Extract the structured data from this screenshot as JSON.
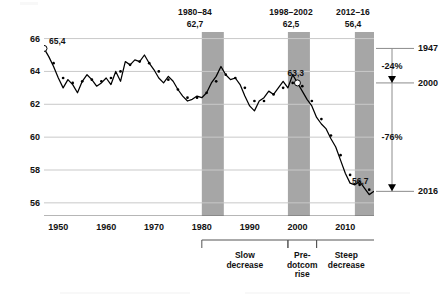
{
  "chart_data": {
    "type": "line",
    "title": "",
    "subtitle": "",
    "xlabel": "",
    "ylabel": "",
    "xlim": [
      1947,
      2016
    ],
    "ylim": [
      55.2,
      66.4
    ],
    "yticks": [
      56,
      58,
      60,
      62,
      64,
      66
    ],
    "ytick_labels": [
      "56",
      "58",
      "60",
      "62",
      "64",
      "66"
    ],
    "xticks": [
      1950,
      1960,
      1970,
      1980,
      1990,
      2000,
      2010
    ],
    "xtick_labels": [
      "1950",
      "1960",
      "1970",
      "1980",
      "1990",
      "2000",
      "2010"
    ],
    "grid": "horizontal",
    "legend": "none",
    "decimal_separator": ",",
    "series": [
      {
        "name": "annual-value",
        "style": "solid-line",
        "color": "#000000",
        "x": [
          1947,
          1948,
          1949,
          1950,
          1951,
          1952,
          1953,
          1954,
          1955,
          1956,
          1957,
          1958,
          1959,
          1960,
          1961,
          1962,
          1963,
          1964,
          1965,
          1966,
          1967,
          1968,
          1969,
          1970,
          1971,
          1972,
          1973,
          1974,
          1975,
          1976,
          1977,
          1978,
          1979,
          1980,
          1981,
          1982,
          1983,
          1984,
          1985,
          1986,
          1987,
          1988,
          1989,
          1990,
          1991,
          1992,
          1993,
          1994,
          1995,
          1996,
          1997,
          1998,
          1999,
          2000,
          2001,
          2002,
          2003,
          2004,
          2005,
          2006,
          2007,
          2008,
          2009,
          2010,
          2011,
          2012,
          2013,
          2014,
          2015,
          2016
        ],
        "values": [
          65.4,
          64.9,
          64.3,
          63.6,
          63.0,
          63.5,
          63.2,
          62.7,
          63.4,
          63.8,
          63.5,
          63.1,
          63.3,
          63.6,
          63.2,
          64.0,
          63.4,
          64.6,
          64.4,
          64.7,
          64.6,
          65.0,
          64.5,
          64.1,
          63.6,
          63.3,
          63.7,
          63.4,
          62.9,
          62.5,
          62.2,
          62.3,
          62.5,
          62.4,
          62.7,
          63.3,
          63.7,
          64.3,
          63.8,
          63.5,
          63.6,
          63.2,
          62.5,
          61.9,
          61.6,
          62.2,
          62.4,
          62.8,
          62.6,
          63.0,
          63.4,
          63.0,
          63.8,
          63.3,
          62.8,
          62.3,
          61.9,
          61.2,
          60.8,
          60.5,
          59.9,
          59.4,
          58.6,
          57.8,
          57.2,
          57.1,
          57.3,
          56.9,
          56.5,
          56.7
        ]
      },
      {
        "name": "smoothed-trend",
        "style": "dotted-line",
        "color": "#000000",
        "x": [
          1947,
          1948,
          1949,
          1950,
          1951,
          1952,
          1953,
          1954,
          1955,
          1956,
          1957,
          1958,
          1959,
          1960,
          1961,
          1962,
          1963,
          1964,
          1965,
          1966,
          1967,
          1968,
          1969,
          1970,
          1971,
          1972,
          1973,
          1974,
          1975,
          1976,
          1977,
          1978,
          1979,
          1980,
          1981,
          1982,
          1983,
          1984,
          1985,
          1986,
          1987,
          1988,
          1989,
          1990,
          1991,
          1992,
          1993,
          1994,
          1995,
          1996,
          1997,
          1998,
          1999,
          2000,
          2001,
          2002,
          2003,
          2004,
          2005,
          2006,
          2007,
          2008,
          2009,
          2010,
          2011,
          2012,
          2013,
          2014,
          2015,
          2016
        ],
        "values": [
          65.4,
          65.0,
          64.5,
          64.0,
          63.6,
          63.4,
          63.3,
          63.3,
          63.4,
          63.5,
          63.5,
          63.4,
          63.4,
          63.5,
          63.6,
          63.8,
          64.0,
          64.2,
          64.4,
          64.5,
          64.6,
          64.6,
          64.5,
          64.3,
          64.0,
          63.7,
          63.5,
          63.2,
          62.9,
          62.6,
          62.4,
          62.4,
          62.4,
          62.5,
          62.7,
          63.0,
          63.4,
          63.7,
          63.8,
          63.7,
          63.6,
          63.3,
          63.0,
          62.5,
          62.2,
          62.1,
          62.2,
          62.4,
          62.6,
          62.8,
          63.0,
          63.2,
          63.3,
          63.3,
          63.1,
          62.7,
          62.2,
          61.6,
          61.1,
          60.6,
          60.1,
          59.5,
          58.9,
          58.2,
          57.7,
          57.3,
          57.1,
          57.0,
          56.8,
          56.7
        ]
      }
    ],
    "point_annotations": [
      {
        "label": "65,4",
        "x": 1947,
        "y": 65.4,
        "marker": "open-circle",
        "position": "right"
      },
      {
        "label": "63,3",
        "x": 2000,
        "y": 63.3,
        "marker": "open-circle",
        "position": "above"
      },
      {
        "label": "56,7",
        "x": 2016,
        "y": 56.7,
        "marker": "none",
        "position": "above"
      }
    ],
    "shaded_bands": [
      {
        "name": "1980-84",
        "years_label": "1980–84",
        "value_label": "62,7",
        "x_start": 1980,
        "x_end": 1984.6,
        "color": "#a6a6a6"
      },
      {
        "name": "1998-2002",
        "years_label": "1998–2002",
        "value_label": "62,5",
        "x_start": 1998,
        "x_end": 2002.6,
        "color": "#a6a6a6"
      },
      {
        "name": "2012-16",
        "years_label": "2012–16",
        "value_label": "56,4",
        "x_start": 2012,
        "x_end": 2016.4,
        "color": "#a6a6a6"
      }
    ],
    "period_brackets": [
      {
        "label": "Slow\ndecrease",
        "x_start": 1980,
        "x_end": 1998
      },
      {
        "label": "Pre-\ndotcom\nrise",
        "x_start": 1998,
        "x_end": 2004
      },
      {
        "label": "Steep\ndecrease",
        "x_start": 2004,
        "x_end": 2016.4
      }
    ],
    "right_scale": {
      "ticks": [
        {
          "label": "1947",
          "y": 65.4
        },
        {
          "label": "2000",
          "y": 63.3
        },
        {
          "label": "2016",
          "y": 56.7
        }
      ],
      "changes": [
        {
          "label": "-24%",
          "from": "1947",
          "to": "2000"
        },
        {
          "label": "-76%",
          "from": "2000",
          "to": "2016"
        }
      ]
    }
  },
  "band_headers": [
    {
      "years": "1980–84",
      "value": "62,7"
    },
    {
      "years": "1998–2002",
      "value": "62,5"
    },
    {
      "years": "2012–16",
      "value": "56,4"
    }
  ],
  "brackets": [
    {
      "line1": "Slow",
      "line2": "decrease",
      "line3": ""
    },
    {
      "line1": "Pre-",
      "line2": "dotcom",
      "line3": "rise"
    },
    {
      "line1": "Steep",
      "line2": "decrease",
      "line3": ""
    }
  ],
  "callouts": {
    "start": "65,4",
    "peak": "63,3",
    "end": "56,7"
  },
  "right_scale_labels": {
    "top_year": "1947",
    "mid_year": "2000",
    "bottom_year": "2016",
    "pct_top": "-24%",
    "pct_bottom": "-76%"
  },
  "colors": {
    "band": "#a6a6a6",
    "grid": "#c9c9c9",
    "line": "#000000",
    "axis": "#6d6d6d"
  }
}
